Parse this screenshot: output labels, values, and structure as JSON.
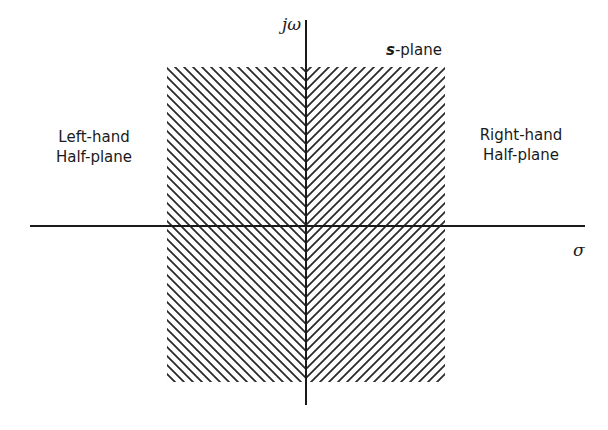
{
  "diagram": {
    "title": "s-plane",
    "title_parts": {
      "var": "s",
      "suffix": "-plane"
    },
    "axes": {
      "vertical_label": "jω",
      "horizontal_label": "σ"
    },
    "regions": {
      "left": {
        "line1": "Left-hand",
        "line2": "Half-plane"
      },
      "right": {
        "line1": "Right-hand",
        "line2": "Half-plane"
      }
    },
    "hatching": {
      "left_half_direction": "backslash",
      "right_half_direction": "slash",
      "color": "#2a2a2a"
    },
    "colors": {
      "ink": "#1a1a1a",
      "background": "#ffffff"
    }
  }
}
